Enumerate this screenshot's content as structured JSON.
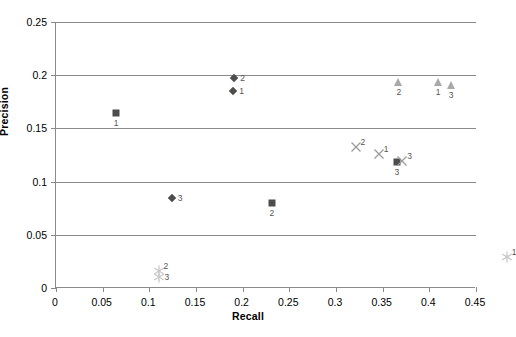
{
  "chart_data": {
    "type": "scatter",
    "title": "",
    "xlabel": "Recall",
    "ylabel": "Precision",
    "xlim": [
      0,
      0.45
    ],
    "ylim": [
      0,
      0.25
    ],
    "xticks": [
      "0",
      "0.05",
      "0.1",
      "0.15",
      "0.2",
      "0.25",
      "0.3",
      "0.35",
      "0.4",
      "0.45"
    ],
    "xtick_values": [
      0,
      0.05,
      0.1,
      0.15,
      0.2,
      0.25,
      0.3,
      0.35,
      0.4,
      0.45
    ],
    "yticks": [
      "0",
      "0.05",
      "0.1",
      "0.15",
      "0.2",
      "0.25"
    ],
    "ytick_values": [
      0,
      0.05,
      0.1,
      0.15,
      0.2,
      0.25
    ],
    "grid": "horizontal",
    "legend": "none",
    "series": [
      {
        "name": "diamond",
        "marker": "diamond",
        "color": "#4d4d4d",
        "points": [
          {
            "x": 0.132,
            "y": 0.218,
            "label": "2",
            "label_pos": "right"
          },
          {
            "x": 0.131,
            "y": 0.206,
            "label": "1",
            "label_pos": "right"
          },
          {
            "x": 0.065,
            "y": 0.105,
            "label": "3",
            "label_pos": "right"
          }
        ]
      },
      {
        "name": "square",
        "marker": "square",
        "color": "#4d4d4d",
        "points": [
          {
            "x": 0.005,
            "y": 0.185,
            "label": "1",
            "label_pos": "below"
          },
          {
            "x": 0.172,
            "y": 0.101,
            "label": "2",
            "label_pos": "below"
          },
          {
            "x": 0.306,
            "y": 0.139,
            "label": "3",
            "label_pos": "below"
          }
        ]
      },
      {
        "name": "triangle",
        "marker": "triangle",
        "color": "#a9a9a9",
        "points": [
          {
            "x": 0.308,
            "y": 0.214,
            "label": "2",
            "label_pos": "below"
          },
          {
            "x": 0.35,
            "y": 0.214,
            "label": "1",
            "label_pos": "below"
          },
          {
            "x": 0.364,
            "y": 0.211,
            "label": "3",
            "label_pos": "below"
          }
        ]
      },
      {
        "name": "cross",
        "marker": "x",
        "color": "#9a9a9a",
        "points": [
          {
            "x": 0.262,
            "y": 0.153,
            "label": "2",
            "label_pos": "upright"
          },
          {
            "x": 0.287,
            "y": 0.147,
            "label": "1",
            "label_pos": "upright"
          },
          {
            "x": 0.312,
            "y": 0.14,
            "label": "3",
            "label_pos": "upright"
          }
        ]
      },
      {
        "name": "star",
        "marker": "star",
        "color": "#c9c9c9",
        "points": [
          {
            "x": 0.051,
            "y": 0.037,
            "label": "2",
            "label_pos": "upright"
          },
          {
            "x": 0.051,
            "y": 0.031,
            "label": "3",
            "label_pos": "right"
          },
          {
            "x": 0.424,
            "y": 0.05,
            "label": "1",
            "label_pos": "upright"
          }
        ]
      }
    ]
  },
  "axis": {
    "x_title": "Recall",
    "y_title": "Precision"
  }
}
